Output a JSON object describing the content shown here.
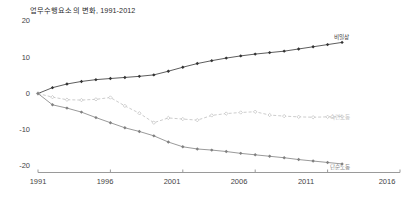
{
  "chart_data": {
    "type": "line",
    "title": "업무수행요소의 변화, 1991-2012",
    "xlabel": "",
    "ylabel": "",
    "xlim": [
      1991,
      2016
    ],
    "ylim": [
      -20,
      20
    ],
    "grid": false,
    "legend_position": "inline-right-end-of-line",
    "x_ticks": [
      "1991",
      "1996",
      "2001",
      "2006",
      "2011",
      "2016"
    ],
    "y_ticks": [
      "20",
      "10",
      "0",
      "-10",
      "-20"
    ],
    "x": [
      1991,
      1992,
      1993,
      1994,
      1995,
      1996,
      1997,
      1998,
      1999,
      2000,
      2001,
      2002,
      2003,
      2004,
      2005,
      2006,
      2007,
      2008,
      2009,
      2010,
      2011,
      2012
    ],
    "series": [
      {
        "name": "비일상",
        "label": "비일상",
        "color": "#333333",
        "marker": "filled-diamond",
        "dash": "solid",
        "values": [
          0,
          1.6,
          2.6,
          3.3,
          3.8,
          4.1,
          4.4,
          4.7,
          5.1,
          6.1,
          7.2,
          8.2,
          9.0,
          9.7,
          10.3,
          10.8,
          11.2,
          11.6,
          12.2,
          12.8,
          13.4,
          14.0
        ]
      },
      {
        "name": "숙련노동",
        "label": "숙련노동",
        "color": "#bfbfbf",
        "marker": "open-diamond",
        "dash": "dashed",
        "values": [
          0,
          -1.0,
          -1.7,
          -1.8,
          -1.6,
          -1.1,
          -3.4,
          -5.4,
          -8.0,
          -6.7,
          -7.0,
          -7.3,
          -6.0,
          -5.5,
          -5.2,
          -5.0,
          -5.9,
          -6.2,
          -6.4,
          -6.5,
          -6.4,
          -6.3
        ]
      },
      {
        "name": "단순노동",
        "label": "단순노동",
        "color": "#808080",
        "marker": "filled-diamond",
        "dash": "solid",
        "values": [
          0,
          -3.1,
          -4.0,
          -5.1,
          -6.6,
          -8.0,
          -9.4,
          -10.4,
          -11.6,
          -13.3,
          -14.6,
          -15.2,
          -15.5,
          -15.9,
          -16.4,
          -16.8,
          -17.2,
          -17.6,
          -18.1,
          -18.5,
          -18.9,
          -19.3
        ]
      }
    ]
  }
}
